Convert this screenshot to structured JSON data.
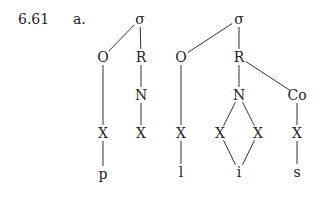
{
  "example": {
    "number": "6.61",
    "sub_label": "a."
  },
  "trees": [
    {
      "id": "tree1",
      "nodes": [
        {
          "id": "s1",
          "label": "σ",
          "x": 140,
          "y": 19
        },
        {
          "id": "o1",
          "label": "O",
          "x": 103,
          "y": 57
        },
        {
          "id": "r1",
          "label": "R",
          "x": 141,
          "y": 57
        },
        {
          "id": "n1",
          "label": "N",
          "x": 141,
          "y": 95
        },
        {
          "id": "xo1",
          "label": "X",
          "x": 103,
          "y": 133
        },
        {
          "id": "xn1",
          "label": "X",
          "x": 141,
          "y": 133
        },
        {
          "id": "p",
          "label": "p",
          "x": 103,
          "y": 174
        }
      ],
      "edges": [
        [
          "s1",
          "o1"
        ],
        [
          "s1",
          "r1"
        ],
        [
          "r1",
          "n1"
        ],
        [
          "n1",
          "xn1"
        ],
        [
          "o1",
          "xo1"
        ],
        [
          "xo1",
          "p"
        ]
      ]
    },
    {
      "id": "tree2",
      "nodes": [
        {
          "id": "s2",
          "label": "σ",
          "x": 239,
          "y": 19
        },
        {
          "id": "o2",
          "label": "O",
          "x": 181,
          "y": 57
        },
        {
          "id": "r2",
          "label": "R",
          "x": 239,
          "y": 57
        },
        {
          "id": "n2",
          "label": "N",
          "x": 239,
          "y": 95
        },
        {
          "id": "co",
          "label": "Co",
          "x": 297,
          "y": 95
        },
        {
          "id": "xo2",
          "label": "X",
          "x": 181,
          "y": 133
        },
        {
          "id": "xa",
          "label": "X",
          "x": 220,
          "y": 133
        },
        {
          "id": "xb",
          "label": "X",
          "x": 258,
          "y": 133
        },
        {
          "id": "xc",
          "label": "X",
          "x": 297,
          "y": 133
        },
        {
          "id": "l",
          "label": "l",
          "x": 181,
          "y": 172
        },
        {
          "id": "i",
          "label": "i",
          "x": 239,
          "y": 172
        },
        {
          "id": "s",
          "label": "s",
          "x": 297,
          "y": 172
        }
      ],
      "edges": [
        [
          "s2",
          "o2"
        ],
        [
          "s2",
          "r2"
        ],
        [
          "r2",
          "n2"
        ],
        [
          "r2",
          "co"
        ],
        [
          "o2",
          "xo2"
        ],
        [
          "xo2",
          "l"
        ],
        [
          "n2",
          "xa"
        ],
        [
          "n2",
          "xb"
        ],
        [
          "xa",
          "i"
        ],
        [
          "xb",
          "i"
        ],
        [
          "co",
          "xc"
        ],
        [
          "xc",
          "s"
        ]
      ]
    }
  ]
}
